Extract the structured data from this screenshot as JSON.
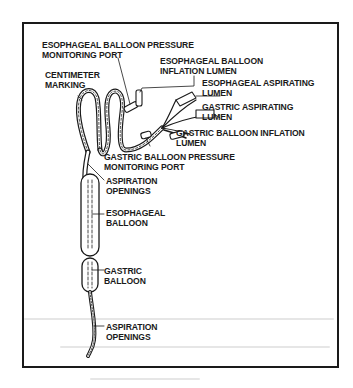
{
  "figure": {
    "labels": {
      "esophageal_balloon_pressure_port": [
        "ESOPHAGEAL BALLOON PRESSURE",
        "MONITORING PORT"
      ],
      "esophageal_balloon_inflation_lumen": [
        "ESOPHAGEAL BALLOON",
        "INFLATION LUMEN"
      ],
      "centimeter_marking": [
        "CENTIMETER",
        "MARKING"
      ],
      "esophageal_aspirating_lumen": [
        "ESOPHAGEAL ASPIRATING",
        "LUMEN"
      ],
      "gastric_aspirating_lumen": [
        "GASTRIC ASPIRATING",
        "LUMEN"
      ],
      "gastric_balloon_inflation_lumen": [
        "GASTRIC BALLOON INFLATION",
        "LUMEN"
      ],
      "gastric_balloon_pressure_port": [
        "GASTRIC BALLOON PRESSURE",
        "MONITORING PORT"
      ],
      "upper_aspiration_openings": [
        "ASPIRATION",
        "OPENINGS"
      ],
      "esophageal_balloon": [
        "ESOPHAGEAL",
        "BALLOON"
      ],
      "gastric_balloon": [
        "GASTRIC",
        "BALLOON"
      ],
      "lower_aspiration_openings": [
        "ASPIRATION",
        "OPENINGS"
      ]
    },
    "colors": {
      "ink": "#1a1a1a",
      "paper": "#ffffff",
      "bleed": "#e6e6e6"
    }
  }
}
